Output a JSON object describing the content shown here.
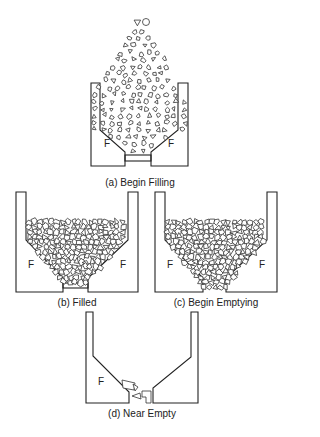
{
  "figure": {
    "panels": [
      {
        "id": "a",
        "caption": "(a) Begin Filling",
        "state": "filling",
        "force_label": "F"
      },
      {
        "id": "b",
        "caption": "(b) Filled",
        "state": "filled",
        "force_label": "F"
      },
      {
        "id": "c",
        "caption": "(c) Begin Emptying",
        "state": "emptying",
        "force_label": "F"
      },
      {
        "id": "d",
        "caption": "(d) Near Empty",
        "state": "near-empty",
        "force_label": "F"
      }
    ]
  }
}
